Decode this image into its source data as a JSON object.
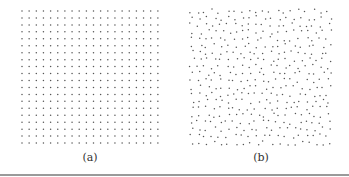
{
  "figure": {
    "panels": [
      {
        "id": "a",
        "caption": "(a)",
        "layout": "regular-grid",
        "x0": 22,
        "y0": 11,
        "cols": 20,
        "rows": 20,
        "spacing_x": 7.15,
        "spacing_y": 6.95,
        "caption_x": 90
      },
      {
        "id": "b",
        "caption": "(b)",
        "layout": "jittered-grid",
        "x0": 191,
        "y0": 11,
        "cols": 20,
        "rows": 20,
        "spacing_x": 7.2,
        "spacing_y": 6.95,
        "jitter": 2.2,
        "seed": 7,
        "caption_x": 261
      }
    ],
    "dot_color": "#555555",
    "dot_radius": 0.75,
    "rule_color": "#9a9a9a"
  }
}
